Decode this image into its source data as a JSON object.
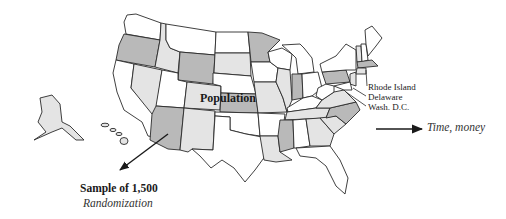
{
  "figure": {
    "type": "map-diagram"
  },
  "labels": {
    "population": "Population",
    "callouts": [
      "Rhode Island",
      "Delaware",
      "Wash. D.C."
    ],
    "sample": "Sample of 1,500",
    "method": "Randomization",
    "cost": "Time, money"
  },
  "colors": {
    "state_stroke": "#2a2a2a",
    "fill_white": "#ffffff",
    "fill_light": "#e4e4e4",
    "fill_mid": "#b9b9b9",
    "arrow": "#1a1a1a"
  },
  "arrows": [
    {
      "name": "sample-arrow",
      "from": "Population (Arizona)",
      "to": "Sample of 1,500",
      "direction": "down-left"
    },
    {
      "name": "time-money-arrow",
      "to": "Time, money",
      "direction": "right"
    }
  ]
}
